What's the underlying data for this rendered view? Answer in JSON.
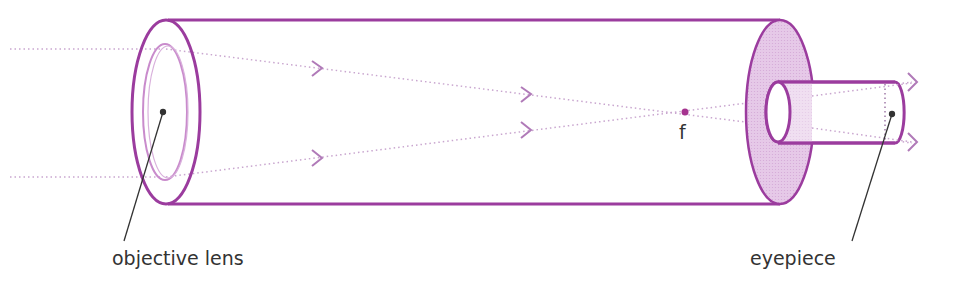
{
  "diagram": {
    "labels": {
      "objective": "objective lens",
      "eyepiece": "eyepiece",
      "focal_point": "f"
    },
    "colors": {
      "tube_outline": "#9b3c9e",
      "lens_outline": "#c98bcc",
      "ray": "#c9a6cf",
      "eyepiece_fill": "#e8cdea",
      "focal_point": "#a5338f",
      "leader_line": "#333333",
      "text": "#333333"
    }
  }
}
